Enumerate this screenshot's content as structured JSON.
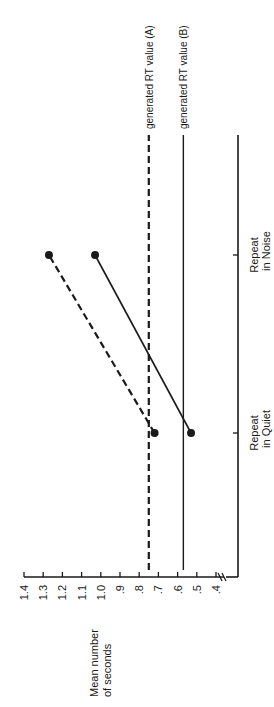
{
  "chart_data": {
    "type": "line",
    "orientation": "rotated-90-ccw",
    "title": "",
    "xlabel": "",
    "ylabel": "Mean number of seconds",
    "ylabel_lines": [
      "Mean number",
      "of seconds"
    ],
    "categories": [
      "Repeat in Quiet",
      "Repeat in Noise"
    ],
    "category_labels": [
      [
        "Repeat",
        "in Quiet"
      ],
      [
        "Repeat",
        "in Noise"
      ]
    ],
    "yticks": [
      "1.4",
      "1.3",
      "1.2",
      "1.1",
      "1.0",
      ".9",
      ".8",
      ".7",
      ".6",
      ".5",
      ".4"
    ],
    "ytick_values": [
      1.4,
      1.3,
      1.2,
      1.1,
      1.0,
      0.9,
      0.8,
      0.7,
      0.6,
      0.5,
      0.4
    ],
    "ylim": [
      0.4,
      1.4
    ],
    "y_axis_break": true,
    "grid": false,
    "series": [
      {
        "name": "Condition A",
        "style": "dashed",
        "marker": "filled-circle",
        "values": [
          0.72,
          1.27
        ]
      },
      {
        "name": "Condition B",
        "style": "solid",
        "marker": "filled-circle",
        "values": [
          0.53,
          1.03
        ]
      }
    ],
    "reference_lines": [
      {
        "label": "generated RT value (A)",
        "value": 0.75,
        "style": "dashed"
      },
      {
        "label": "generated RT value (B)",
        "value": 0.57,
        "style": "solid"
      }
    ]
  },
  "colors": {
    "ink": "#1a1a1a",
    "background": "#ffffff"
  }
}
